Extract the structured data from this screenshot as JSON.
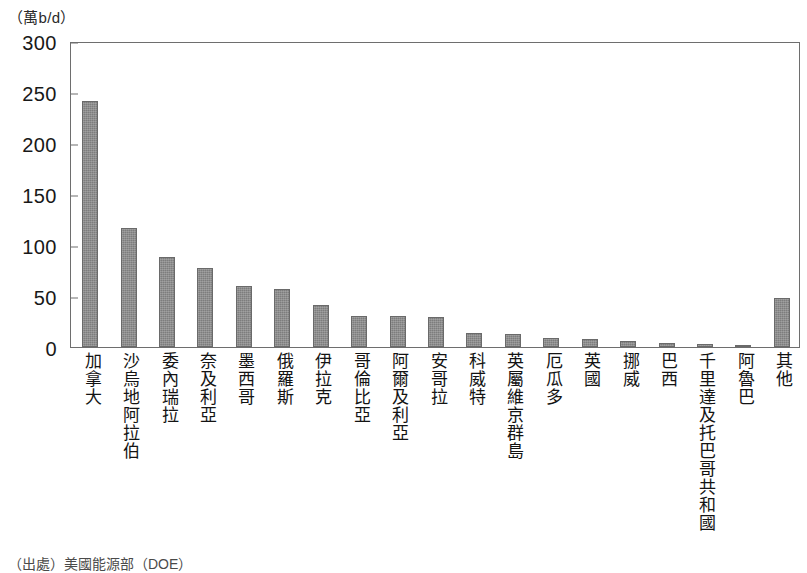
{
  "unit_caption": "（萬b/d）",
  "source_note": "（出處）美國能源部（DOE）",
  "colors": {
    "bar_fill": "#7d7d7d",
    "axis": "#6e6e6e",
    "text": "#131313",
    "background": "#ffffff"
  },
  "chart_data": {
    "type": "bar",
    "title": "",
    "subtitle": "",
    "xlabel": "",
    "ylabel": "（萬b/d）",
    "ylim": [
      0,
      300
    ],
    "yticks": [
      0,
      50,
      100,
      150,
      200,
      250,
      300
    ],
    "ytick_labels": [
      "0",
      "50",
      "100",
      "150",
      "200",
      "250",
      "300"
    ],
    "grid": false,
    "legend": false,
    "legend_position": "none",
    "categories": [
      "加拿大",
      "沙烏地阿拉伯",
      "委內瑞拉",
      "奈及利亞",
      "墨西哥",
      "俄羅斯",
      "伊拉克",
      "哥倫比亞",
      "阿爾及利亞",
      "安哥拉",
      "科威特",
      "英屬維京群島",
      "厄瓜多",
      "英國",
      "挪威",
      "巴西",
      "千里達及托巴哥共和國",
      "阿魯巴",
      "其他"
    ],
    "values": [
      241,
      117,
      88,
      77,
      60,
      57,
      41,
      30,
      30,
      29,
      14,
      13,
      9,
      8,
      6,
      4,
      3,
      2,
      48
    ],
    "series": [
      {
        "name": "原油進口量",
        "values": [
          241,
          117,
          88,
          77,
          60,
          57,
          41,
          30,
          30,
          29,
          14,
          13,
          9,
          8,
          6,
          4,
          3,
          2,
          48
        ]
      }
    ]
  }
}
